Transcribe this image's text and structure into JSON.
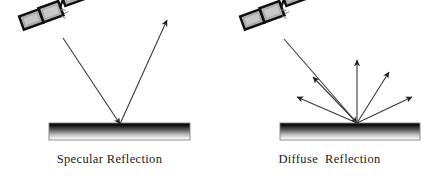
{
  "figure": {
    "background_color": "#ffffff",
    "width": 439,
    "height": 184
  },
  "panels": [
    {
      "id": "specular",
      "caption": "Specular Reflection",
      "source": {
        "icon": "satellite-icon",
        "panel_count": 3,
        "body_color": "#b9b9b9",
        "outline_color": "#111111"
      },
      "surface": {
        "label": "smooth-surface",
        "x": 49,
        "y": 123,
        "width": 141,
        "height": 17,
        "gradient_top_color": "#000000",
        "gradient_bottom_color": "#ffffff",
        "border_color": "#7a7a7a"
      },
      "rays": [
        {
          "name": "incident-ray",
          "from_x": 63,
          "from_y": 38,
          "to_x": 120,
          "to_y": 124,
          "arrow": "end",
          "color": "#3a3a3a"
        },
        {
          "name": "reflected-ray",
          "from_x": 120,
          "from_y": 124,
          "to_x": 167,
          "to_y": 20,
          "arrow": "end",
          "color": "#3a3a3a"
        }
      ],
      "hit_point": {
        "x": 120,
        "y": 124
      }
    },
    {
      "id": "diffuse",
      "caption": "Diffuse  Reflection",
      "source": {
        "icon": "satellite-icon",
        "panel_count": 3,
        "body_color": "#b9b9b9",
        "outline_color": "#111111"
      },
      "surface": {
        "label": "rough-surface",
        "x": 60,
        "y": 123,
        "width": 140,
        "height": 17,
        "gradient_top_color": "#000000",
        "gradient_bottom_color": "#ffffff",
        "border_color": "#7a7a7a"
      },
      "rays": [
        {
          "name": "incident-ray",
          "from_x": 64,
          "from_y": 39,
          "to_x": 137,
          "to_y": 123,
          "arrow": "end",
          "color": "#3a3a3a"
        },
        {
          "name": "scattered-ray-1",
          "from_x": 137,
          "from_y": 123,
          "to_x": 77,
          "to_y": 97,
          "arrow": "end",
          "color": "#3a3a3a"
        },
        {
          "name": "scattered-ray-2",
          "from_x": 137,
          "from_y": 123,
          "to_x": 93,
          "to_y": 77,
          "arrow": "end",
          "color": "#3a3a3a"
        },
        {
          "name": "scattered-ray-3",
          "from_x": 137,
          "from_y": 123,
          "to_x": 137,
          "to_y": 60,
          "arrow": "end",
          "color": "#3a3a3a"
        },
        {
          "name": "scattered-ray-4",
          "from_x": 137,
          "from_y": 123,
          "to_x": 169,
          "to_y": 72,
          "arrow": "end",
          "color": "#3a3a3a"
        },
        {
          "name": "scattered-ray-5",
          "from_x": 137,
          "from_y": 123,
          "to_x": 192,
          "to_y": 97,
          "arrow": "end",
          "color": "#3a3a3a"
        }
      ],
      "hit_point": {
        "x": 137,
        "y": 123
      }
    }
  ]
}
